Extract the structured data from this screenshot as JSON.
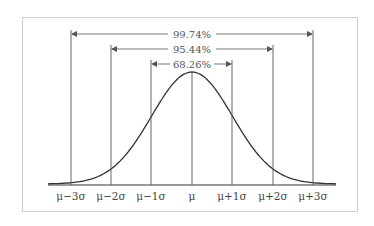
{
  "chart_data": {
    "type": "line",
    "title": "",
    "xlabel": "",
    "ylabel": "",
    "x_ticks": [
      "μ−3σ",
      "μ−2σ",
      "μ−1σ",
      "μ",
      "μ+1σ",
      "μ+2σ",
      "μ+3σ"
    ],
    "intervals": [
      {
        "label": "68.26%",
        "from": "μ−1σ",
        "to": "μ+1σ"
      },
      {
        "label": "95.44%",
        "from": "μ−2σ",
        "to": "μ+2σ"
      },
      {
        "label": "99.74%",
        "from": "μ−3σ",
        "to": "μ+3σ"
      }
    ],
    "grid": false,
    "legend": null
  },
  "labels": {
    "ticks": [
      "μ−3σ",
      "μ−2σ",
      "μ−1σ",
      "μ",
      "μ+1σ",
      "μ+2σ",
      "μ+3σ"
    ],
    "pct1": "68.26%",
    "pct2": "95.44%",
    "pct3": "99.74%"
  },
  "colors": {
    "line": "#333333",
    "text": "#444444",
    "frame": "#cfcfcf"
  }
}
